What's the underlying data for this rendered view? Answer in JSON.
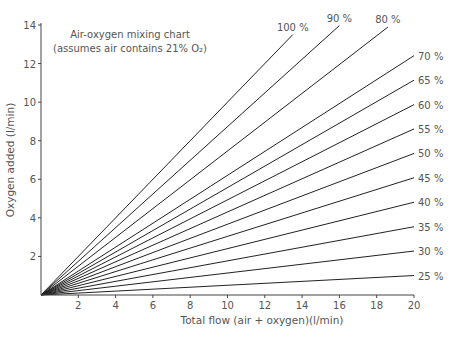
{
  "chart_data": {
    "type": "line",
    "title": "Air-oxygen mixing chart",
    "subtitle": "(assumes air contains 21% O₂)",
    "xlabel": "Total flow (air + oxygen)(l/min)",
    "ylabel": "Oxygen added (l/min)",
    "xlim": [
      0,
      20
    ],
    "ylim": [
      0,
      14
    ],
    "x_ticks": [
      2,
      4,
      6,
      8,
      10,
      12,
      14,
      16,
      18,
      20
    ],
    "y_ticks": [
      2,
      4,
      6,
      8,
      10,
      12,
      14
    ],
    "grid": false,
    "legend": "inline labels at line ends",
    "formula": "oxygen_added = total_flow * (percent - 21) / 79",
    "series": [
      {
        "name": "100 %",
        "percent": 100,
        "x": [
          0,
          13.5
        ],
        "y": [
          0,
          13.5
        ]
      },
      {
        "name": "90 %",
        "percent": 90,
        "x": [
          0,
          16.0
        ],
        "y": [
          0,
          13.97
        ]
      },
      {
        "name": "80 %",
        "percent": 80,
        "x": [
          0,
          18.6
        ],
        "y": [
          0,
          13.89
        ]
      },
      {
        "name": "70 %",
        "percent": 70,
        "x": [
          0,
          20
        ],
        "y": [
          0,
          12.41
        ]
      },
      {
        "name": "65 %",
        "percent": 65,
        "x": [
          0,
          20
        ],
        "y": [
          0,
          11.14
        ]
      },
      {
        "name": "60 %",
        "percent": 60,
        "x": [
          0,
          20
        ],
        "y": [
          0,
          9.87
        ]
      },
      {
        "name": "55 %",
        "percent": 55,
        "x": [
          0,
          20
        ],
        "y": [
          0,
          8.61
        ]
      },
      {
        "name": "50 %",
        "percent": 50,
        "x": [
          0,
          20
        ],
        "y": [
          0,
          7.34
        ]
      },
      {
        "name": "45 %",
        "percent": 45,
        "x": [
          0,
          20
        ],
        "y": [
          0,
          6.08
        ]
      },
      {
        "name": "40 %",
        "percent": 40,
        "x": [
          0,
          20
        ],
        "y": [
          0,
          4.81
        ]
      },
      {
        "name": "35 %",
        "percent": 35,
        "x": [
          0,
          20
        ],
        "y": [
          0,
          3.54
        ]
      },
      {
        "name": "30 %",
        "percent": 30,
        "x": [
          0,
          20
        ],
        "y": [
          0,
          2.28
        ]
      },
      {
        "name": "25 %",
        "percent": 25,
        "x": [
          0,
          20
        ],
        "y": [
          0,
          1.01
        ]
      }
    ]
  },
  "colors": {
    "line": "#222222",
    "text": "#555555",
    "axis": "#444444",
    "background": "#ffffff"
  }
}
